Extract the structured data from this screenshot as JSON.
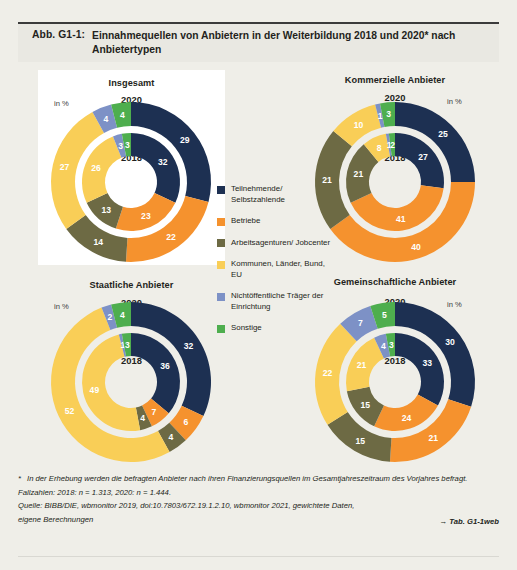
{
  "header": {
    "figure_number": "Abb. G1-1:",
    "title": "Einnahmequellen von Anbietern in der Weiterbildung 2018 und 2020* nach Anbietertypen"
  },
  "units_label": "in %",
  "year_outer": "2020",
  "year_inner": "2018",
  "legend": {
    "items": [
      {
        "label": "Teilnehmende/ Selbstzahlende",
        "color": "#1d3052"
      },
      {
        "label": "Betriebe",
        "color": "#f5922e"
      },
      {
        "label": "Arbeitsagenturen/ Jobcenter",
        "color": "#6d6a44"
      },
      {
        "label": "Kommunen, Länder, Bund, EU",
        "color": "#f9ce57"
      },
      {
        "label": "Nichtöffentliche Träger der Einrichtung",
        "color": "#7d91c6"
      },
      {
        "label": "Sonstige",
        "color": "#4eae4e"
      }
    ]
  },
  "footnotes": {
    "star": "*",
    "note": "In der Erhebung werden die befragten Anbieter nach ihren Finanzierungsquellen im Gesamtjahreszeitraum des Vorjahres befragt.",
    "cases": "Fallzahlen: 2018: n = 1.313, 2020: n = 1.444.",
    "source_line1": "Quelle: BIBB/DIE, wbmonitor 2019, doi:10.7803/672.19.1.2.10, wbmonitor 2021, gewichtete Daten,",
    "source_line2": "eigene Berechnungen",
    "table_ref": "→ Tab. G1-1web"
  },
  "chart_data": {
    "type": "pie",
    "title": "Einnahmequellen von Anbietern in der Weiterbildung 2018 und 2020* nach Anbietertypen",
    "unit": "percent",
    "categories": [
      "Teilnehmende/Selbstzahlende",
      "Betriebe",
      "Arbeitsagenturen/Jobcenter",
      "Kommunen, Länder, Bund, EU",
      "Nichtöffentliche Träger der Einrichtung",
      "Sonstige"
    ],
    "colors": [
      "#1d3052",
      "#f5922e",
      "#6d6a44",
      "#f9ce57",
      "#7d91c6",
      "#4eae4e"
    ],
    "rings": [
      "2020",
      "2018"
    ],
    "panels": [
      {
        "name": "Insgesamt",
        "series": [
          {
            "name": "2020",
            "values": [
              29,
              22,
              14,
              27,
              4,
              4
            ]
          },
          {
            "name": "2018",
            "values": [
              32,
              23,
              13,
              26,
              3,
              3
            ]
          }
        ]
      },
      {
        "name": "Kommerzielle Anbieter",
        "series": [
          {
            "name": "2020",
            "values": [
              25,
              40,
              21,
              10,
              1,
              3
            ]
          },
          {
            "name": "2018",
            "values": [
              27,
              41,
              21,
              8,
              1,
              2
            ]
          }
        ]
      },
      {
        "name": "Staatliche Anbieter",
        "series": [
          {
            "name": "2020",
            "values": [
              32,
              6,
              4,
              52,
              2,
              4
            ]
          },
          {
            "name": "2018",
            "values": [
              36,
              7,
              4,
              49,
              1,
              3
            ]
          }
        ]
      },
      {
        "name": "Gemeinschaftliche Anbieter",
        "series": [
          {
            "name": "2020",
            "values": [
              30,
              21,
              15,
              22,
              7,
              5
            ]
          },
          {
            "name": "2018",
            "values": [
              33,
              24,
              15,
              21,
              4,
              3
            ]
          }
        ]
      }
    ]
  },
  "panel_layout": [
    {
      "x": 20,
      "y": 8,
      "w": 187,
      "h": 195,
      "cx": 93,
      "cy": 112,
      "title_top": 8,
      "units_x": 16,
      "units_y": 29,
      "units_align": "left",
      "outer_lab_y": 24,
      "inner_lab_y": 82
    },
    {
      "x": 277,
      "y": 8,
      "w": 200,
      "h": 195,
      "cx": 100,
      "cy": 112,
      "title_top": 5,
      "units_x": 152,
      "units_y": 27,
      "units_align": "left",
      "outer_lab_y": 22,
      "inner_lab_y": 82
    },
    {
      "x": 20,
      "y": 210,
      "w": 187,
      "h": 194,
      "cx": 93,
      "cy": 110,
      "title_top": 8,
      "units_x": 16,
      "units_y": 30,
      "units_align": "left",
      "outer_lab_y": 25,
      "inner_lab_y": 83
    },
    {
      "x": 277,
      "y": 210,
      "w": 200,
      "h": 194,
      "cx": 100,
      "cy": 110,
      "title_top": 5,
      "units_x": 152,
      "units_y": 28,
      "units_align": "left",
      "outer_lab_y": 24,
      "inner_lab_y": 83
    }
  ]
}
